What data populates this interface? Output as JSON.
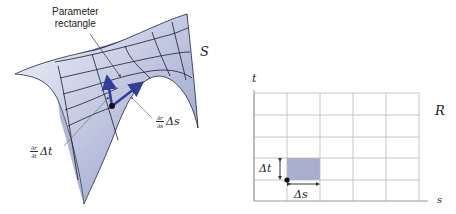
{
  "surface_panel": {
    "surface_label": "S",
    "callout_parameter_rectangle": [
      "Parameter",
      "rectangle"
    ],
    "partial_s": {
      "numerator": "∂r",
      "denominator": "∂s",
      "increment": "Δs"
    },
    "partial_t": {
      "numerator": "∂r",
      "denominator": "∂t",
      "increment": "Δt"
    },
    "colors": {
      "surface_light": "#eef0f8",
      "surface_mid": "#b9c0dc",
      "surface_dark": "#3a3f78",
      "grid_lines": "#1c1c2c",
      "vector_arrows": "#2f3f9a"
    }
  },
  "parameter_panel": {
    "region_label": "R",
    "axis_horizontal": "s",
    "axis_vertical": "t",
    "delta_s": "Δs",
    "delta_t": "Δt",
    "grid": {
      "columns": 5,
      "rows": 5
    },
    "highlighted_cell": {
      "column": 2,
      "row_from_bottom": 2
    },
    "colors": {
      "grid_lines": "#b8b8b8",
      "highlight_fill": "#a9aed0",
      "axis": "#8a8a8a"
    }
  }
}
